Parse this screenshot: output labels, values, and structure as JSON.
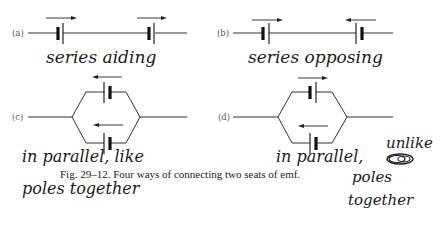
{
  "figure": {
    "caption": "Fig. 29–12.  Four ways of connecting two seats of emf.",
    "panels": [
      {
        "label": "(a)",
        "configuration": "series",
        "annotation": "series aiding",
        "emf_directions": [
          "right",
          "right"
        ]
      },
      {
        "label": "(b)",
        "configuration": "series",
        "annotation": "series opposing",
        "emf_directions": [
          "right",
          "left"
        ]
      },
      {
        "label": "(c)",
        "configuration": "parallel",
        "annotation_line1": "in parallel, like",
        "annotation_line2": "poles together",
        "emf_directions": [
          "left",
          "left"
        ]
      },
      {
        "label": "(d)",
        "configuration": "parallel",
        "annotation_line1": "in parallel,",
        "annotation_side1": "unlike",
        "annotation_side2": "poles",
        "annotation_side3": "together",
        "emf_directions": [
          "right",
          "left"
        ]
      }
    ]
  },
  "colors": {
    "ink": "#222222",
    "handwriting": "#1a1a1a",
    "background": "#ffffff"
  }
}
